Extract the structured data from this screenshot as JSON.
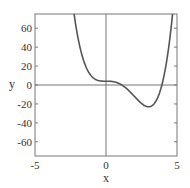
{
  "chart_data": {
    "type": "line",
    "title": "",
    "xlabel": "x",
    "ylabel": "y",
    "xlim": [
      -5,
      5
    ],
    "ylim": [
      -75,
      75
    ],
    "x_ticks": [
      -5,
      0,
      5
    ],
    "x_tick_labels": [
      "-5",
      "0",
      "5"
    ],
    "y_ticks": [
      -60,
      -40,
      -20,
      0,
      20,
      40,
      60
    ],
    "y_tick_labels": [
      "-60",
      "-40",
      "-20",
      "0",
      "20",
      "40",
      "60"
    ],
    "grid": false,
    "legend": null,
    "zero_lines": true,
    "series": [
      {
        "name": "y = x^4 - 4x^3 + 4",
        "color": "#555555",
        "x": [
          -2.25,
          -2.0,
          -1.5,
          -1.0,
          -0.5,
          0.0,
          0.5,
          1.0,
          1.5,
          2.0,
          2.5,
          3.0,
          3.5,
          4.0,
          4.5,
          4.68
        ],
        "values": [
          75.2,
          52,
          22.6,
          9,
          4.6,
          4,
          3.6,
          1,
          -4.4,
          -12,
          -19.4,
          -23,
          -17.4,
          4,
          49.6,
          75
        ]
      }
    ]
  }
}
